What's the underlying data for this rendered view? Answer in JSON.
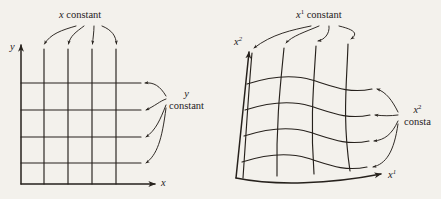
{
  "figure": {
    "type": "diagram",
    "background_color": "#f3f1ec",
    "ink_color": "#26211c"
  },
  "left_panel": {
    "name": "cartesian-grid",
    "axes": {
      "vertical_label": "y",
      "horizontal_label": "x"
    },
    "annotations": {
      "constant_family_top": {
        "text_prefix": "x",
        "text_suffix": " constant",
        "full": "x constant",
        "arrow_count": 4,
        "points_to": "vertical grid lines"
      },
      "constant_family_right": {
        "line1": "y",
        "line2": "constant",
        "full": "y constant",
        "arrow_count": 4,
        "points_to": "horizontal grid lines"
      }
    },
    "grid": {
      "vertical_line_count": 4,
      "horizontal_line_count": 4,
      "straight": true
    }
  },
  "right_panel": {
    "name": "curvilinear-grid",
    "axes": {
      "vertical_label_base": "x",
      "vertical_label_sup": "2",
      "horizontal_label_base": "x",
      "horizontal_label_sup": "1"
    },
    "annotations": {
      "constant_family_top": {
        "base": "x",
        "sup": "1",
        "suffix": " constant",
        "full": "x1 constant",
        "arrow_count": 4,
        "points_to": "curved grid lines of first family"
      },
      "constant_family_right": {
        "line1_base": "x",
        "line1_sup": "2",
        "line2": "consta",
        "line2_note": "clipped at image edge",
        "full": "x2 constant",
        "arrow_count": 4,
        "points_to": "curved grid lines of second family"
      }
    },
    "grid": {
      "family1_line_count": 4,
      "family2_line_count": 4,
      "straight": false,
      "shape": "S-curved wavy mesh"
    }
  }
}
